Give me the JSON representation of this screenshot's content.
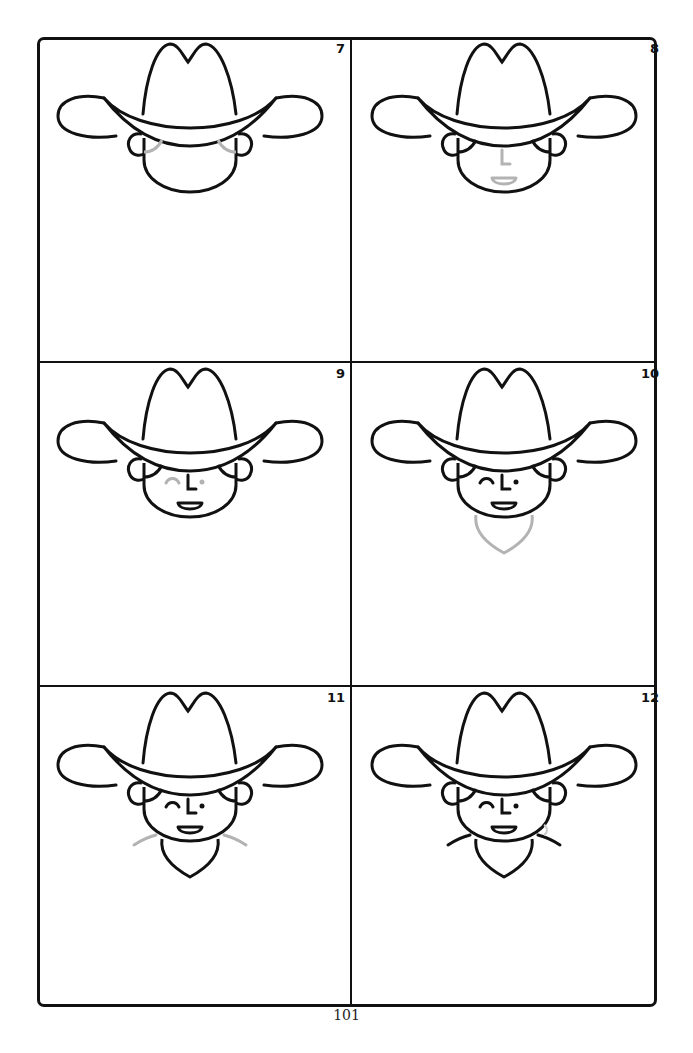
{
  "page": {
    "page_number": "101",
    "line_color": "#111111",
    "new_step_color": "#b3b3b3"
  },
  "panels": [
    {
      "step": "7",
      "new_element": "cheek/hair curves under brim",
      "features": [
        "hat",
        "ears",
        "face",
        "hair"
      ]
    },
    {
      "step": "8",
      "new_element": "nose and smile",
      "features": [
        "hat",
        "ears",
        "face",
        "hair",
        "nose",
        "mouth"
      ]
    },
    {
      "step": "9",
      "new_element": "winking eye and open eye",
      "features": [
        "hat",
        "ears",
        "face",
        "hair",
        "nose",
        "mouth",
        "eyes"
      ]
    },
    {
      "step": "10",
      "new_element": "bandana below chin",
      "features": [
        "hat",
        "ears",
        "face",
        "hair",
        "nose",
        "mouth",
        "eyes",
        "bandana"
      ]
    },
    {
      "step": "11",
      "new_element": "shoulder lines",
      "features": [
        "hat",
        "ears",
        "face",
        "hair",
        "nose",
        "mouth",
        "eyes",
        "bandana",
        "shoulders"
      ]
    },
    {
      "step": "12",
      "new_element": "finished drawing",
      "features": [
        "hat",
        "ears",
        "face",
        "hair",
        "nose",
        "mouth",
        "eyes",
        "bandana",
        "shoulders"
      ]
    }
  ]
}
